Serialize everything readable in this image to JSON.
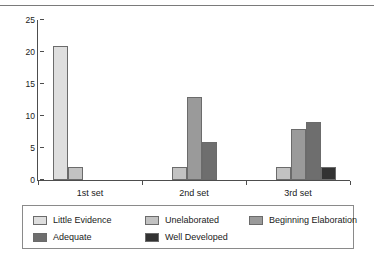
{
  "chart_data": {
    "type": "bar",
    "title": "",
    "subtitle": "",
    "xlabel": "",
    "ylabel": "",
    "categories": [
      "1st set",
      "2nd set",
      "3rd set"
    ],
    "series": [
      {
        "name": "Little Evidence",
        "color": "#dedede",
        "values": [
          21,
          0,
          0
        ]
      },
      {
        "name": "Unelaborated",
        "color": "#c2c2c2",
        "values": [
          2,
          2,
          2
        ]
      },
      {
        "name": "Beginning Elaboration",
        "color": "#9a9a9a",
        "values": [
          0,
          13,
          8
        ]
      },
      {
        "name": "Adequate",
        "color": "#6e6e6e",
        "values": [
          0,
          6,
          9
        ]
      },
      {
        "name": "Well Developed",
        "color": "#333333",
        "values": [
          0,
          0,
          2
        ]
      }
    ],
    "ylim": [
      0,
      25
    ],
    "yticks": [
      0,
      5,
      10,
      15,
      20,
      25
    ],
    "ytick_labels": [
      "0",
      "5",
      "10",
      "15",
      "20",
      "25"
    ],
    "grid": false,
    "legend_position": "bottom",
    "legend_columns": 3
  }
}
